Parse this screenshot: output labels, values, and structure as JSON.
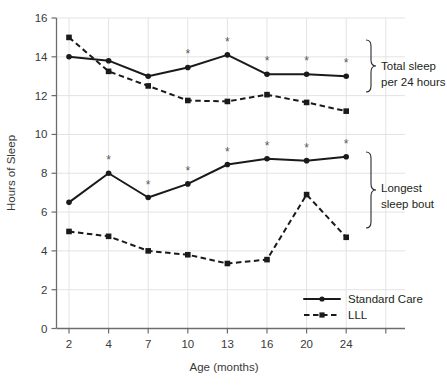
{
  "chart_data": {
    "type": "line",
    "title": "",
    "xlabel": "Age (months)",
    "ylabel": "Hours of Sleep",
    "x": [
      2,
      4,
      7,
      10,
      13,
      16,
      20,
      24
    ],
    "categories": [
      "2",
      "4",
      "7",
      "10",
      "13",
      "16",
      "20",
      "24"
    ],
    "ylim": [
      0,
      16
    ],
    "yticks": [
      0,
      2,
      4,
      6,
      8,
      10,
      12,
      14,
      16
    ],
    "ytick_labels": [
      "0",
      "2",
      "4",
      "6",
      "8",
      "10",
      "12",
      "14",
      "16"
    ],
    "grid": true,
    "legend_position": "bottom-right",
    "groups": [
      {
        "name": "Total sleep per 24 hours",
        "annotation": "Total sleep\nper 24 hours",
        "series": [
          {
            "name": "Standard Care",
            "style": "solid",
            "marker": "circle",
            "values": [
              14.0,
              13.8,
              13.0,
              13.45,
              14.1,
              13.1,
              13.1,
              13.0
            ],
            "significant": [
              false,
              false,
              false,
              true,
              true,
              true,
              true,
              true
            ]
          },
          {
            "name": "LLL",
            "style": "dashed",
            "marker": "square",
            "values": [
              15.0,
              13.25,
              12.5,
              11.75,
              11.7,
              12.05,
              11.65,
              11.2
            ],
            "significant": [
              false,
              false,
              false,
              false,
              false,
              false,
              false,
              false
            ]
          }
        ]
      },
      {
        "name": "Longest sleep bout",
        "annotation": "Longest\nsleep bout",
        "series": [
          {
            "name": "Standard Care",
            "style": "solid",
            "marker": "circle",
            "values": [
              6.5,
              8.0,
              6.75,
              7.45,
              8.45,
              8.75,
              8.65,
              8.85
            ],
            "significant": [
              false,
              true,
              true,
              true,
              true,
              true,
              true,
              true
            ]
          },
          {
            "name": "LLL",
            "style": "dashed",
            "marker": "square",
            "values": [
              5.0,
              4.75,
              4.0,
              3.8,
              3.35,
              3.55,
              6.9,
              4.7
            ],
            "significant": [
              false,
              false,
              false,
              false,
              false,
              false,
              false,
              false
            ]
          }
        ]
      }
    ],
    "legend": [
      {
        "label": "Standard Care",
        "style": "solid",
        "marker": "circle"
      },
      {
        "label": "LLL",
        "style": "dashed",
        "marker": "square"
      }
    ],
    "annotations": [
      {
        "label_line1": "Total sleep",
        "label_line2": "per 24 hours"
      },
      {
        "label_line1": "Longest",
        "label_line2": "sleep bout"
      }
    ],
    "significance_symbol": "*",
    "colors": {
      "line": "#1a1a1a",
      "grid": "#e3e3e3",
      "axis": "#6d6d6d",
      "text": "#231f20",
      "star": "#5a5a5a"
    }
  }
}
